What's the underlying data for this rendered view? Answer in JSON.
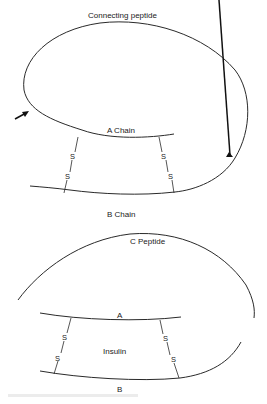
{
  "figure": {
    "proinsulin": {
      "connecting_label": "Connecting peptide",
      "a_chain_label": "A Chain",
      "b_chain_label": "B Chain",
      "bond_left_top": "S",
      "bond_left_bottom": "S",
      "bond_right_top": "S",
      "bond_right_bottom": "S",
      "arrows": [
        "cleavage-arrow-left",
        "cleavage-arrow-right"
      ]
    },
    "insulin": {
      "c_peptide_label": "C Peptide",
      "a_label": "A",
      "b_label": "B",
      "center_label": "Insulin",
      "bond_left_top": "S",
      "bond_left_bottom": "S",
      "bond_right_top": "S",
      "bond_right_bottom": "S"
    }
  }
}
